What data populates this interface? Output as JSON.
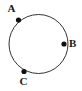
{
  "figure": {
    "background_color": "#ffffff",
    "stroke_color": "#333333",
    "point_color": "#111111",
    "label_color": "#1a1a1a",
    "canvas": {
      "width": 82,
      "height": 91
    }
  },
  "chart_data": {
    "type": "scatter",
    "title": "",
    "subtitle": "",
    "xlabel": "",
    "ylabel": "",
    "grid": false,
    "legend": "none",
    "xlim": [
      0,
      82
    ],
    "ylim": [
      0,
      91
    ],
    "shapes": [
      {
        "kind": "circle",
        "name": "main-circle",
        "cx": 38.5,
        "cy": 44.0,
        "r": 29.5,
        "stroke": "#333333",
        "stroke_width": 1,
        "fill": "none"
      }
    ],
    "points": [
      {
        "label": "A",
        "x": 18.5,
        "y": 20.0,
        "angle_deg": 141,
        "marker": "filled-circle",
        "radius": 2.6,
        "label_position": "upper-left"
      },
      {
        "label": "B",
        "x": 64.0,
        "y": 44.0,
        "angle_deg": 0,
        "marker": "filled-circle",
        "radius": 2.6,
        "label_position": "right"
      },
      {
        "label": "C",
        "x": 24.0,
        "y": 71.5,
        "angle_deg": 241,
        "marker": "filled-circle",
        "radius": 2.6,
        "label_position": "below-left"
      }
    ],
    "labels": [
      {
        "text": "A",
        "x": 11.5,
        "y": 9.0
      },
      {
        "text": "B",
        "x": 73.0,
        "y": 44.0
      },
      {
        "text": "C",
        "x": 23.5,
        "y": 81.5
      }
    ]
  }
}
